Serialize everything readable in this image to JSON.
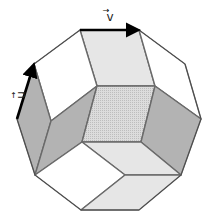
{
  "diagram": {
    "vectors": [
      {
        "name": "v",
        "label": "v",
        "from": [
          80,
          30
        ],
        "to": [
          139,
          30
        ]
      },
      {
        "name": "u",
        "label": "u",
        "from": [
          17,
          119
        ],
        "to": [
          34,
          64
        ]
      }
    ],
    "colors": {
      "white": "#ffffff",
      "light": "#e6e6e6",
      "dark": "#b3b3b3",
      "dotted": "#d2d2d2",
      "edge": "#6a6a6a",
      "vector": "#000000"
    },
    "tiles": [
      {
        "name": "top-rhombus",
        "shade": "light",
        "points": "80,30 139,30 155,86 97,86"
      },
      {
        "name": "upper-left-rhombus",
        "shade": "white",
        "points": "34,64 80,30 97,86 51,121"
      },
      {
        "name": "left-rhombus",
        "shade": "dark",
        "points": "17,119 34,64 51,121 35,175"
      },
      {
        "name": "mid-left-rhombus",
        "shade": "dark",
        "points": "51,121 97,86 82,142 35,175"
      },
      {
        "name": "center-rhombus",
        "shade": "dotted",
        "points": "97,86 155,86 141,142 82,142"
      },
      {
        "name": "upper-right-rhombus",
        "shade": "white",
        "points": "139,30 185,64 201,119 155,86"
      },
      {
        "name": "right-rhombus",
        "shade": "dark",
        "points": "155,86 201,119 181,175 141,142"
      },
      {
        "name": "lower-center-rhombus",
        "shade": "light",
        "points": "82,142 141,142 181,175 125,175"
      },
      {
        "name": "lower-left-rhombus",
        "shade": "white",
        "points": "35,175 82,142 125,175 81,210"
      },
      {
        "name": "bottom-rhombus",
        "shade": "light",
        "points": "125,175 181,175 139,210 81,210"
      }
    ],
    "outline": "80,30 139,30 185,64 201,119 181,175 139,210 81,210 35,175 17,119 34,64"
  }
}
